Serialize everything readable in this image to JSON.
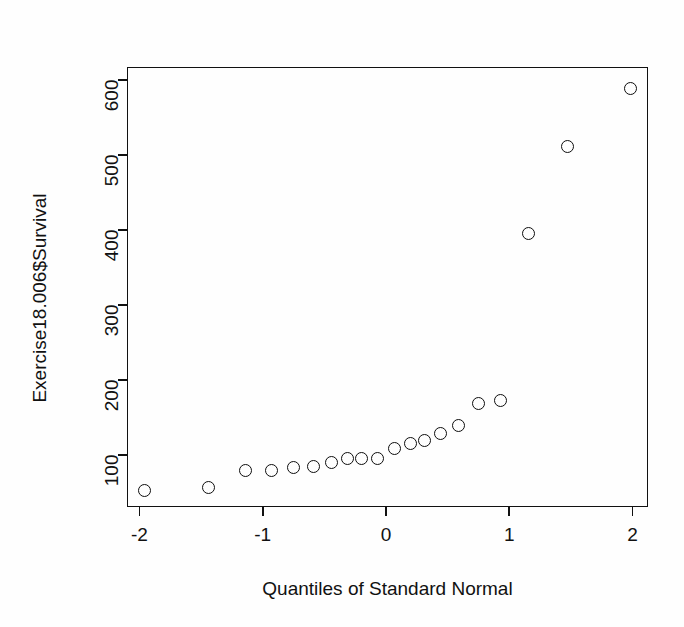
{
  "chart_data": {
    "type": "scatter",
    "title": "",
    "xlabel": "Quantiles of Standard Normal",
    "ylabel": "Exercise18.006$Survival",
    "xlim": [
      -2.18,
      2.18
    ],
    "ylim": [
      41,
      614
    ],
    "grid": false,
    "legend": null,
    "xticks": [
      -2,
      -1,
      0,
      1,
      2
    ],
    "xticklabels": [
      "-2",
      "-1",
      "0",
      "1",
      "2"
    ],
    "yticks": [
      100,
      200,
      300,
      400,
      500,
      600
    ],
    "yticklabels": [
      "100",
      "200",
      "300",
      "400",
      "500",
      "600"
    ],
    "marker": "open-circle",
    "point_color": "#0d0d0d",
    "background": "#ffffff",
    "n_points": 20,
    "x": [
      -1.96,
      -1.44,
      -1.14,
      -0.93,
      -0.75,
      -0.59,
      -0.44,
      -0.31,
      -0.2,
      -0.065,
      0.065,
      0.2,
      0.31,
      0.44,
      0.59,
      0.75,
      0.93,
      1.16,
      1.47,
      1.98
    ],
    "y": [
      53,
      57,
      79,
      80,
      84,
      85,
      90,
      95,
      95,
      96,
      109,
      116,
      119,
      129,
      140,
      169,
      173,
      396,
      512,
      589
    ],
    "points": [
      {
        "x": -1.96,
        "y": 53
      },
      {
        "x": -1.44,
        "y": 57
      },
      {
        "x": -1.14,
        "y": 79
      },
      {
        "x": -0.93,
        "y": 80
      },
      {
        "x": -0.75,
        "y": 84
      },
      {
        "x": -0.59,
        "y": 85
      },
      {
        "x": -0.44,
        "y": 90
      },
      {
        "x": -0.31,
        "y": 95
      },
      {
        "x": -0.2,
        "y": 95
      },
      {
        "x": -0.065,
        "y": 96
      },
      {
        "x": 0.065,
        "y": 109
      },
      {
        "x": 0.2,
        "y": 116
      },
      {
        "x": 0.31,
        "y": 119
      },
      {
        "x": 0.44,
        "y": 129
      },
      {
        "x": 0.59,
        "y": 140
      },
      {
        "x": 0.75,
        "y": 169
      },
      {
        "x": 0.93,
        "y": 173
      },
      {
        "x": 1.16,
        "y": 396
      },
      {
        "x": 1.47,
        "y": 512
      },
      {
        "x": 1.98,
        "y": 589
      }
    ]
  }
}
